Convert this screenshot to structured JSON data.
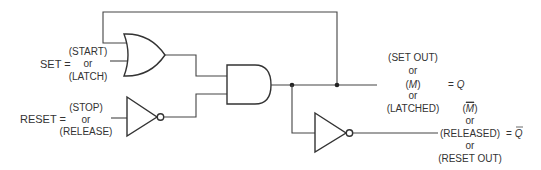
{
  "diagram": {
    "type": "logic-circuit-latch",
    "inputs": {
      "set": {
        "label": "SET =",
        "alt1": "(START)",
        "or": "or",
        "alt2": "(LATCH)"
      },
      "reset": {
        "label": "RESET =",
        "alt1": "(STOP)",
        "or": "or",
        "alt2": "(RELEASE)"
      }
    },
    "gates": [
      {
        "id": "or-gate",
        "type": "OR",
        "inputs": [
          "feedback",
          "SET"
        ]
      },
      {
        "id": "not-gate-reset",
        "type": "NOT",
        "inputs": [
          "RESET"
        ]
      },
      {
        "id": "and-gate",
        "type": "AND",
        "inputs": [
          "or-gate",
          "not-gate-reset"
        ]
      },
      {
        "id": "not-gate-output",
        "type": "NOT",
        "inputs": [
          "and-gate"
        ]
      }
    ],
    "outputs": {
      "q": {
        "alt1": "(SET OUT)",
        "or1": "or",
        "alt2": "(",
        "alt2_var": "M",
        "alt2_close": ")",
        "or2": "or",
        "alt3": "(LATCHED)",
        "equals": "= ",
        "symbol": "Q"
      },
      "q_bar": {
        "alt1_open": "(",
        "alt1_var": "M",
        "alt1_close": ")",
        "or1": "or",
        "alt2": "(RELEASED)",
        "or2": "or",
        "alt3": "(RESET OUT)",
        "equals": "= ",
        "symbol": "Q"
      }
    },
    "colors": {
      "line": "#444444",
      "text": "#333333",
      "background": "#ffffff"
    }
  }
}
